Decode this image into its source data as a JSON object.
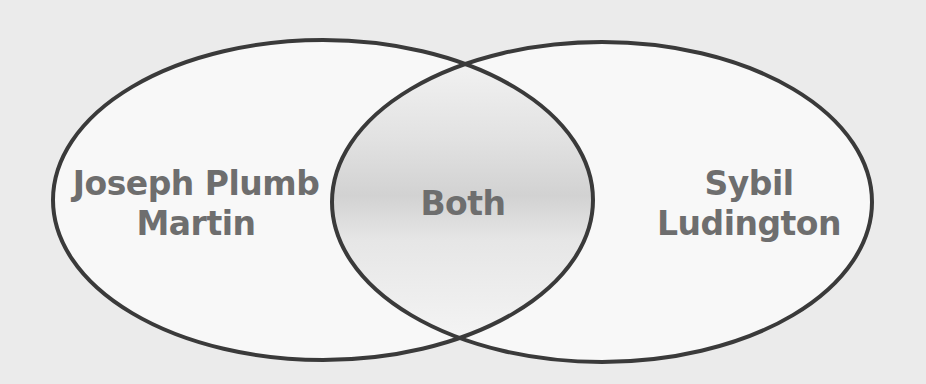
{
  "diagram": {
    "type": "venn",
    "sets": [
      {
        "id": "left",
        "label_lines": [
          "Joseph Plumb",
          "Martin"
        ]
      },
      {
        "id": "right",
        "label_lines": [
          "Sybil",
          "Ludington"
        ]
      }
    ],
    "intersection": {
      "label": "Both"
    }
  },
  "colors": {
    "background": "#ebebeb",
    "fill": "#f8f8f8",
    "intersection_shade": "#d4d4d4",
    "outline": "#3a3a3a",
    "text": "#6e6e6e"
  }
}
